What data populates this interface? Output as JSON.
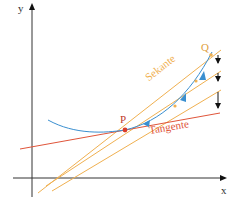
{
  "diagram": {
    "axes": {
      "x_label": "x",
      "y_label": "y"
    },
    "points": {
      "P": "P",
      "Q": "Q"
    },
    "labels": {
      "secant": "Sekante",
      "tangent": "Tangente"
    },
    "colors": {
      "axis": "#333333",
      "curve": "#3a8fd0",
      "secant": "#f0b050",
      "tangent": "#e0553a",
      "point": "#d93a2a",
      "arrow": "#111111"
    }
  }
}
